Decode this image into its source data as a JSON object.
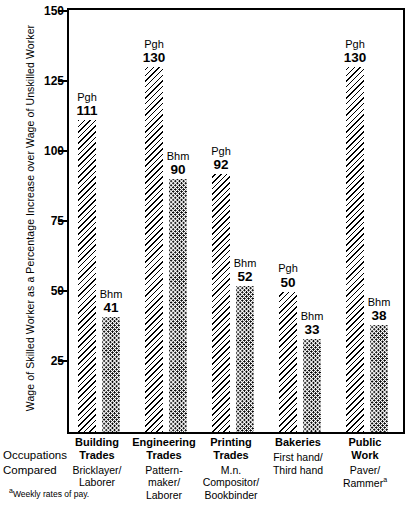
{
  "chart_data": {
    "type": "bar",
    "title": "",
    "xlabel": "Occupations Compared",
    "ylabel": "Wage of Skilled Worker as a Percentage Increase over Wage of Unskilled Worker",
    "ylim": [
      0,
      150
    ],
    "yticks": [
      150,
      125,
      100,
      75,
      50,
      25
    ],
    "grid": false,
    "legend_position": "none",
    "categories": [
      "Building Trades",
      "Engineering Trades",
      "Printing Trades",
      "Bakeries",
      "Public Work"
    ],
    "series": [
      {
        "name": "Pgh",
        "values": [
          111,
          130,
          92,
          50,
          130
        ]
      },
      {
        "name": "Bhm",
        "values": [
          41,
          90,
          52,
          33,
          38
        ]
      }
    ],
    "footnote": "Weekly rates of pay.",
    "footnote_marker": "a"
  },
  "axis": {
    "y_title": "Wage of Skilled Worker as a Percentage Increase over Wage of Unskilled Worker",
    "ticks": [
      {
        "label": "150",
        "value": 150
      },
      {
        "label": "125",
        "value": 125
      },
      {
        "label": "100",
        "value": 100
      },
      {
        "label": "75",
        "value": 75
      },
      {
        "label": "50",
        "value": 50
      },
      {
        "label": "25",
        "value": 25
      }
    ]
  },
  "x_axis": {
    "caption_line1": "Occupations",
    "caption_line2": "Compared",
    "groups": [
      {
        "head_line1": "Building",
        "head_line2": "Trades",
        "sub_line1": "Bricklayer/",
        "sub_line2": "Laborer",
        "sub_line3": ""
      },
      {
        "head_line1": "Engineering",
        "head_line2": "Trades",
        "sub_line1": "Pattern-",
        "sub_line2": "maker/",
        "sub_line3": "Laborer"
      },
      {
        "head_line1": "Printing",
        "head_line2": "Trades",
        "sub_line1": "M.n.",
        "sub_line2": "Compositor/",
        "sub_line3": "Bookbinder"
      },
      {
        "head_line1": "Bakeries",
        "head_line2": "",
        "sub_line1": "First hand/",
        "sub_line2": "Third hand",
        "sub_line3": ""
      },
      {
        "head_line1": "Public",
        "head_line2": "Work",
        "sub_line1": "Paver/",
        "sub_line2": "Rammer",
        "sub_line3": "",
        "sub_line2_marker": "a"
      }
    ]
  },
  "bars": [
    {
      "group": 0,
      "city": "Pgh",
      "value": "111",
      "pattern": "diagonal-hatch"
    },
    {
      "group": 0,
      "city": "Bhm",
      "value": "41",
      "pattern": "dot-stipple"
    },
    {
      "group": 1,
      "city": "Pgh",
      "value": "130",
      "pattern": "diagonal-hatch"
    },
    {
      "group": 1,
      "city": "Bhm",
      "value": "90",
      "pattern": "dot-stipple"
    },
    {
      "group": 2,
      "city": "Pgh",
      "value": "92",
      "pattern": "diagonal-hatch"
    },
    {
      "group": 2,
      "city": "Bhm",
      "value": "52",
      "pattern": "dot-stipple"
    },
    {
      "group": 3,
      "city": "Pgh",
      "value": "50",
      "pattern": "diagonal-hatch"
    },
    {
      "group": 3,
      "city": "Bhm",
      "value": "33",
      "pattern": "dot-stipple"
    },
    {
      "group": 4,
      "city": "Pgh",
      "value": "130",
      "pattern": "diagonal-hatch"
    },
    {
      "group": 4,
      "city": "Bhm",
      "value": "38",
      "pattern": "dot-stipple"
    }
  ],
  "footnote": {
    "marker": "a",
    "text": "Weekly rates of pay."
  },
  "colors": {
    "ink": "#000000",
    "background": "#ffffff"
  }
}
